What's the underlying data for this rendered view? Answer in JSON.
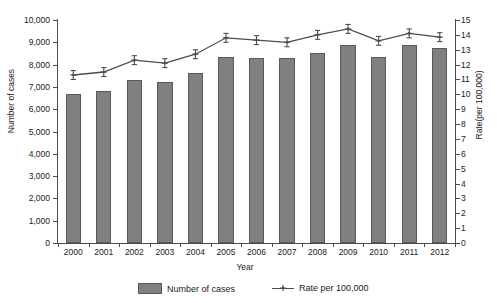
{
  "chart_data": {
    "type": "bar",
    "title": "",
    "xlabel": "Year",
    "ylabel": "Number of cases",
    "y2label": "Rate(per 100,000)",
    "categories": [
      "2000",
      "2001",
      "2002",
      "2003",
      "2004",
      "2005",
      "2006",
      "2007",
      "2008",
      "2009",
      "2010",
      "2011",
      "2012"
    ],
    "ylim": [
      0,
      10000
    ],
    "y2lim": [
      0,
      15
    ],
    "yticks": [
      "0",
      "1,000",
      "2,000",
      "3,000",
      "4,000",
      "5,000",
      "6,000",
      "7,000",
      "8,000",
      "9,000",
      "10,000"
    ],
    "ytick_values": [
      0,
      1000,
      2000,
      3000,
      4000,
      5000,
      6000,
      7000,
      8000,
      9000,
      10000
    ],
    "y2ticks": [
      "0",
      "1",
      "2",
      "3",
      "4",
      "5",
      "6",
      "7",
      "8",
      "9",
      "10",
      "11",
      "12",
      "13",
      "14",
      "15"
    ],
    "y2tick_values": [
      0,
      1,
      2,
      3,
      4,
      5,
      6,
      7,
      8,
      9,
      10,
      11,
      12,
      13,
      14,
      15
    ],
    "grid": false,
    "legend_position": "bottom",
    "series": [
      {
        "name": "Number of cases",
        "kind": "bar",
        "axis": "left",
        "color": "#808080",
        "values": [
          6700,
          6820,
          7300,
          7220,
          7620,
          8330,
          8310,
          8280,
          8540,
          8900,
          8340,
          8900,
          8760
        ]
      },
      {
        "name": "Rate per 100,000",
        "kind": "line",
        "axis": "right",
        "color": "#4d4d4d",
        "values": [
          11.3,
          11.5,
          12.3,
          12.1,
          12.7,
          13.8,
          13.65,
          13.5,
          14.0,
          14.4,
          13.6,
          14.1,
          13.85
        ],
        "error_low": [
          11.0,
          11.2,
          12.0,
          11.8,
          12.4,
          13.5,
          13.35,
          13.2,
          13.7,
          14.1,
          13.3,
          13.8,
          13.55
        ],
        "error_high": [
          11.6,
          11.8,
          12.6,
          12.4,
          13.0,
          14.1,
          13.95,
          13.8,
          14.3,
          14.7,
          13.9,
          14.4,
          14.15
        ]
      }
    ]
  },
  "legend": {
    "bar_label": "Number of cases",
    "line_label": "Rate per 100,000"
  }
}
